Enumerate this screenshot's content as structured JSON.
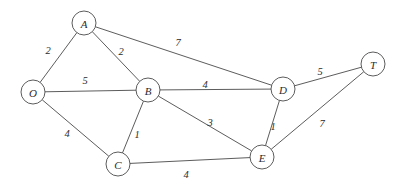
{
  "figure": {
    "title": "",
    "background_color": "#ffffff",
    "line_color": "#4a4a4a",
    "text_color": "#2b2b2b",
    "width": 408,
    "height": 191
  },
  "chart_data": {
    "type": "diagram",
    "diagram_kind": "weighted-undirected-graph",
    "title": "",
    "xlabel": "",
    "ylabel": "",
    "nodes": [
      {
        "id": "O",
        "label": "O",
        "x": 33,
        "y": 92,
        "r": 12
      },
      {
        "id": "A",
        "label": "A",
        "x": 84,
        "y": 23,
        "r": 12
      },
      {
        "id": "B",
        "label": "B",
        "x": 148,
        "y": 90,
        "r": 12
      },
      {
        "id": "C",
        "label": "C",
        "x": 118,
        "y": 164,
        "r": 12
      },
      {
        "id": "D",
        "label": "D",
        "x": 283,
        "y": 89,
        "r": 12
      },
      {
        "id": "E",
        "label": "E",
        "x": 262,
        "y": 157,
        "r": 12
      },
      {
        "id": "T",
        "label": "T",
        "x": 373,
        "y": 64,
        "r": 12
      }
    ],
    "edges": [
      {
        "source": "O",
        "target": "A",
        "weight": 2,
        "label": "2",
        "label_x": 48,
        "label_y": 50
      },
      {
        "source": "A",
        "target": "B",
        "weight": 2,
        "label": "2",
        "label_x": 121,
        "label_y": 51
      },
      {
        "source": "A",
        "target": "D",
        "weight": 7,
        "label": "7",
        "label_x": 178,
        "label_y": 42
      },
      {
        "source": "O",
        "target": "B",
        "weight": 5,
        "label": "5",
        "label_x": 85,
        "label_y": 80
      },
      {
        "source": "B",
        "target": "D",
        "weight": 4,
        "label": "4",
        "label_x": 205,
        "label_y": 84
      },
      {
        "source": "D",
        "target": "T",
        "weight": 5,
        "label": "5",
        "label_x": 320,
        "label_y": 71
      },
      {
        "source": "O",
        "target": "C",
        "weight": 4,
        "label": "4",
        "label_x": 67,
        "label_y": 133
      },
      {
        "source": "B",
        "target": "C",
        "weight": 1,
        "label": "1",
        "label_x": 137,
        "label_y": 134
      },
      {
        "source": "B",
        "target": "E",
        "weight": 3,
        "label": "3",
        "label_x": 210,
        "label_y": 122
      },
      {
        "source": "C",
        "target": "E",
        "weight": 4,
        "label": "4",
        "label_x": 186,
        "label_y": 174
      },
      {
        "source": "D",
        "target": "E",
        "weight": 1,
        "label": "1",
        "label_x": 273,
        "label_y": 126
      },
      {
        "source": "E",
        "target": "T",
        "weight": 7,
        "label": "7",
        "label_x": 322,
        "label_y": 123
      }
    ],
    "node_count": 7,
    "edge_count": 12,
    "legend": [],
    "annotations": []
  }
}
